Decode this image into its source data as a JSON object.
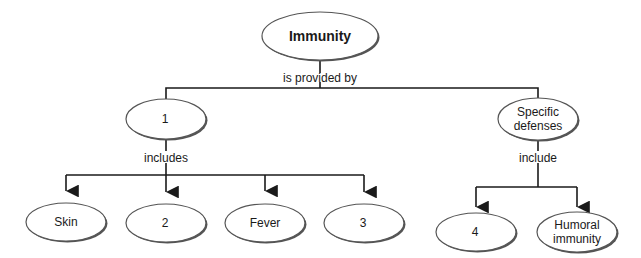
{
  "diagram": {
    "type": "concept-map",
    "nodes": {
      "root": {
        "label": "Immunity"
      },
      "n1": {
        "label": "1"
      },
      "specific": {
        "line1": "Specific",
        "line2": "defenses"
      },
      "skin": {
        "label": "Skin"
      },
      "n2": {
        "label": "2"
      },
      "fever": {
        "label": "Fever"
      },
      "n3": {
        "label": "3"
      },
      "n4": {
        "label": "4"
      },
      "humoral": {
        "line1": "Humoral",
        "line2": "immunity"
      }
    },
    "links": {
      "root_to_children": "is provided by",
      "n1_to_children": "includes",
      "specific_to_children": "include"
    },
    "edges": [
      [
        "Immunity",
        "1",
        "is provided by"
      ],
      [
        "Immunity",
        "Specific defenses",
        "is provided by"
      ],
      [
        "1",
        "Skin",
        "includes"
      ],
      [
        "1",
        "2",
        "includes"
      ],
      [
        "1",
        "Fever",
        "includes"
      ],
      [
        "1",
        "3",
        "includes"
      ],
      [
        "Specific defenses",
        "4",
        "include"
      ],
      [
        "Specific defenses",
        "Humoral immunity",
        "include"
      ]
    ]
  },
  "colors": {
    "line": "#1a1a1a",
    "ellipse_fill": "#ffffff",
    "ellipse_shadow": "#555555"
  }
}
